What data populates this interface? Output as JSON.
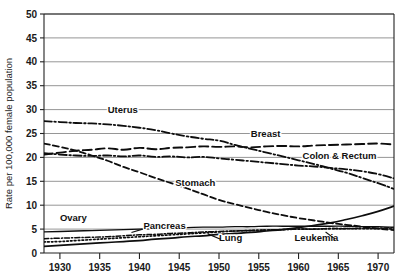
{
  "chart_data": {
    "type": "line",
    "title": "",
    "subtitle": "",
    "xlabel": "",
    "ylabel": "Rate per 100,000 female population",
    "xlim": [
      1928,
      1972
    ],
    "ylim": [
      0,
      50
    ],
    "grid": "horizontal",
    "legend_position": "inline-labels",
    "yticks": [
      0,
      5,
      10,
      15,
      20,
      25,
      30,
      35,
      40,
      45,
      50
    ],
    "ytick_labels": [
      "0",
      "5",
      "10",
      "15",
      "20",
      "25",
      "30",
      "35",
      "40",
      "45",
      "50"
    ],
    "xticks": [
      1930,
      1935,
      1940,
      1945,
      1950,
      1955,
      1960,
      1965,
      1970
    ],
    "xtick_labels": [
      "1930",
      "1935",
      "1940",
      "1945",
      "1950",
      "1955",
      "1960",
      "1965",
      "1970"
    ],
    "series": [
      {
        "name": "Uterus",
        "label": "Uterus",
        "style": "dash-dot",
        "label_x": 1936.0,
        "label_y": 29.3,
        "x": [
          1928,
          1930,
          1932,
          1934,
          1936,
          1938,
          1940,
          1942,
          1944,
          1946,
          1948,
          1950,
          1952,
          1954,
          1956,
          1958,
          1960,
          1962,
          1964,
          1966,
          1968,
          1970,
          1972
        ],
        "values": [
          27.6,
          27.4,
          27.2,
          27.1,
          26.9,
          26.6,
          26.2,
          25.7,
          25.0,
          24.4,
          23.9,
          23.5,
          22.6,
          21.8,
          21.0,
          20.2,
          19.4,
          18.6,
          17.7,
          16.8,
          15.7,
          14.6,
          13.4
        ]
      },
      {
        "name": "Breast",
        "label": "Breast",
        "style": "long-dash",
        "label_x": 1954.0,
        "label_y": 24.3,
        "x": [
          1928,
          1930,
          1932,
          1934,
          1936,
          1938,
          1940,
          1942,
          1944,
          1946,
          1948,
          1950,
          1952,
          1954,
          1956,
          1958,
          1960,
          1962,
          1964,
          1966,
          1968,
          1970,
          1972
        ],
        "values": [
          20.6,
          21.0,
          21.4,
          21.6,
          21.9,
          21.6,
          22.0,
          21.7,
          22.0,
          22.1,
          22.3,
          22.2,
          22.3,
          22.1,
          22.3,
          22.4,
          22.3,
          22.5,
          22.6,
          22.7,
          22.8,
          22.9,
          22.7
        ]
      },
      {
        "name": "Colon & Rectum",
        "label": "Colon & Rectum",
        "style": "dash-dot",
        "label_x": 1960.5,
        "label_y": 19.6,
        "x": [
          1928,
          1930,
          1932,
          1934,
          1936,
          1938,
          1940,
          1942,
          1944,
          1946,
          1948,
          1950,
          1952,
          1954,
          1956,
          1958,
          1960,
          1962,
          1964,
          1966,
          1968,
          1970,
          1972
        ],
        "values": [
          20.9,
          20.6,
          20.4,
          20.3,
          20.4,
          20.2,
          20.4,
          20.1,
          20.2,
          20.0,
          20.1,
          19.8,
          19.5,
          19.2,
          18.9,
          18.6,
          18.3,
          18.1,
          17.8,
          17.5,
          17.1,
          16.5,
          15.6
        ]
      },
      {
        "name": "Stomach",
        "label": "Stomach",
        "style": "dash",
        "label_x": 1944.5,
        "label_y": 14.0,
        "x": [
          1928,
          1930,
          1932,
          1934,
          1936,
          1938,
          1940,
          1942,
          1944,
          1946,
          1948,
          1950,
          1952,
          1954,
          1956,
          1958,
          1960,
          1962,
          1964,
          1966,
          1968,
          1970,
          1972
        ],
        "values": [
          22.9,
          22.2,
          21.4,
          20.4,
          19.3,
          18.0,
          16.9,
          15.7,
          14.6,
          13.5,
          12.3,
          11.1,
          10.2,
          9.4,
          8.6,
          7.9,
          7.3,
          6.8,
          6.3,
          5.9,
          5.5,
          5.1,
          4.8
        ]
      },
      {
        "name": "Ovary",
        "label": "Ovary",
        "style": "solid-thin",
        "label_x": 1930.0,
        "label_y": 6.6,
        "x": [
          1928,
          1930,
          1932,
          1934,
          1936,
          1938,
          1940,
          1942,
          1944,
          1946,
          1948,
          1950,
          1952,
          1954,
          1956,
          1958,
          1960,
          1962,
          1964,
          1966,
          1968,
          1970,
          1972
        ],
        "values": [
          4.4,
          4.5,
          4.6,
          4.7,
          4.8,
          4.9,
          5.0,
          5.1,
          5.2,
          5.3,
          5.4,
          5.4,
          5.5,
          5.5,
          5.6,
          5.6,
          5.6,
          5.6,
          5.6,
          5.6,
          5.5,
          5.5,
          5.4
        ]
      },
      {
        "name": "Pancreas",
        "label": "Pancreas",
        "style": "dash-dot-fine",
        "label_x": 1940.5,
        "label_y": 5.1,
        "x": [
          1928,
          1930,
          1932,
          1934,
          1936,
          1938,
          1940,
          1942,
          1944,
          1946,
          1948,
          1950,
          1952,
          1954,
          1956,
          1958,
          1960,
          1962,
          1964,
          1966,
          1968,
          1970,
          1972
        ],
        "values": [
          3.0,
          3.1,
          3.2,
          3.3,
          3.4,
          3.6,
          3.8,
          3.9,
          4.1,
          4.2,
          4.4,
          4.5,
          4.6,
          4.7,
          4.8,
          4.9,
          5.0,
          5.0,
          5.1,
          5.1,
          5.2,
          5.2,
          5.3
        ]
      },
      {
        "name": "Lung",
        "label": "Lung",
        "style": "solid",
        "label_x": 1950.0,
        "label_y": 2.6,
        "x": [
          1928,
          1930,
          1932,
          1934,
          1936,
          1938,
          1940,
          1942,
          1944,
          1946,
          1948,
          1950,
          1952,
          1954,
          1956,
          1958,
          1960,
          1962,
          1964,
          1966,
          1968,
          1970,
          1972
        ],
        "values": [
          1.4,
          1.6,
          1.8,
          2.0,
          2.2,
          2.4,
          2.6,
          2.9,
          3.1,
          3.4,
          3.6,
          3.9,
          4.1,
          4.3,
          4.6,
          4.9,
          5.3,
          5.8,
          6.3,
          7.0,
          7.8,
          8.7,
          9.8
        ]
      },
      {
        "name": "Leukemia",
        "label": "Leukemia",
        "style": "dotted",
        "label_x": 1959.5,
        "label_y": 2.6,
        "x": [
          1928,
          1930,
          1932,
          1934,
          1936,
          1938,
          1940,
          1942,
          1944,
          1946,
          1948,
          1950,
          1952,
          1954,
          1956,
          1958,
          1960,
          1962,
          1964,
          1966,
          1968,
          1970,
          1972
        ],
        "values": [
          2.3,
          2.4,
          2.6,
          2.8,
          3.0,
          3.2,
          3.4,
          3.6,
          3.8,
          4.0,
          4.2,
          4.4,
          4.6,
          4.7,
          4.8,
          4.9,
          5.0,
          5.0,
          5.1,
          5.1,
          5.1,
          5.1,
          5.0
        ]
      }
    ]
  },
  "axes": {
    "y_title": "Rate per 100,000 female population"
  }
}
